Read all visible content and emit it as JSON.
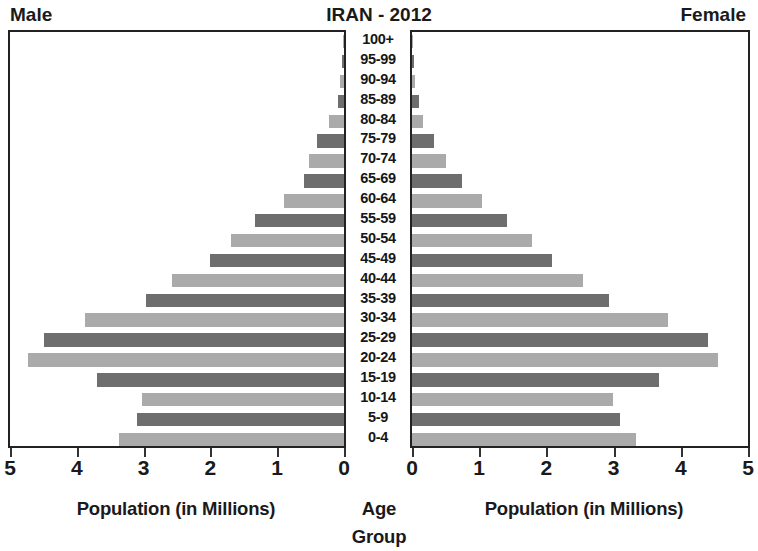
{
  "header": {
    "male_label": "Male",
    "title": "IRAN - 2012",
    "female_label": "Female"
  },
  "captions": {
    "left": "Population (in Millions)",
    "center": "Age Group",
    "right": "Population (in Millions)"
  },
  "axis": {
    "male_ticks": [
      "5",
      "4",
      "3",
      "2",
      "1",
      "0"
    ],
    "female_ticks": [
      "0",
      "1",
      "2",
      "3",
      "4",
      "5"
    ]
  },
  "colors": {
    "bar_dark": "#6e6e6e",
    "bar_light": "#aaaaaa",
    "frame": "#222222",
    "text": "#1a1a1a",
    "background": "#ffffff"
  },
  "chart_data": {
    "type": "bar",
    "title": "IRAN - 2012",
    "subtype": "population-pyramid",
    "xlabel": "Population (in Millions)",
    "ylabel": "Age Group",
    "xlim": [
      0,
      5
    ],
    "xticks": [
      0,
      1,
      2,
      3,
      4,
      5
    ],
    "grid": false,
    "legend": "none",
    "categories": [
      "100+",
      "95-99",
      "90-94",
      "85-89",
      "80-84",
      "75-79",
      "70-74",
      "65-69",
      "60-64",
      "55-59",
      "50-54",
      "45-49",
      "40-44",
      "35-39",
      "30-34",
      "25-29",
      "20-24",
      "15-19",
      "10-14",
      "5-9",
      "0-4"
    ],
    "series": [
      {
        "name": "Male",
        "side": "left",
        "values": [
          0.01,
          0.03,
          0.06,
          0.09,
          0.22,
          0.4,
          0.52,
          0.6,
          0.9,
          1.34,
          1.69,
          2.01,
          2.57,
          2.96,
          3.87,
          4.49,
          4.73,
          3.7,
          3.02,
          3.1,
          3.37
        ]
      },
      {
        "name": "Female",
        "side": "right",
        "values": [
          0.02,
          0.03,
          0.04,
          0.1,
          0.17,
          0.32,
          0.5,
          0.75,
          1.04,
          1.42,
          1.79,
          2.09,
          2.55,
          2.93,
          3.81,
          4.4,
          4.55,
          3.67,
          2.99,
          3.1,
          3.34
        ]
      }
    ],
    "bar_shades": [
      "light",
      "dark",
      "light",
      "dark",
      "light",
      "dark",
      "light",
      "dark",
      "light",
      "dark",
      "light",
      "dark",
      "light",
      "dark",
      "light",
      "dark",
      "light",
      "dark",
      "light",
      "dark",
      "light"
    ]
  }
}
